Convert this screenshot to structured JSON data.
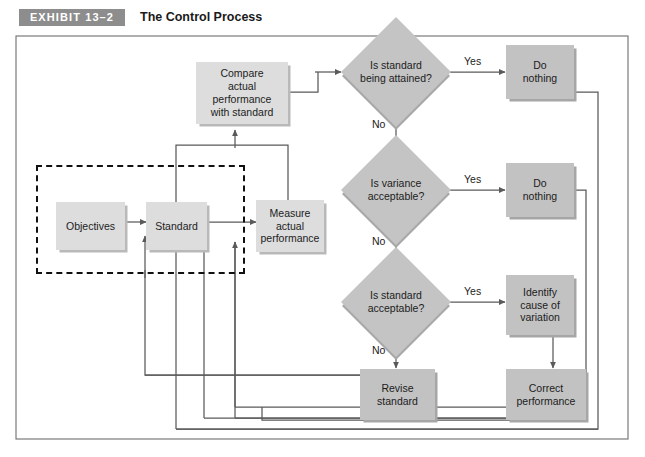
{
  "header": {
    "exhibit_badge": "EXHIBIT 13–2",
    "title": "The Control Process"
  },
  "diagram": {
    "type": "flowchart",
    "nodes": {
      "objectives": "Objectives",
      "standard": "Standard",
      "measure": "Measure\nactual\nperformance",
      "compare": "Compare\nactual\nperformance\nwith standard",
      "do_nothing_1": "Do\nnothing",
      "do_nothing_2": "Do\nnothing",
      "identify_cause": "Identify\ncause of\nvariation",
      "revise_standard": "Revise\nstandard",
      "correct_performance": "Correct\nperformance"
    },
    "decisions": {
      "attained": "Is standard\nbeing attained?",
      "variance": "Is variance\nacceptable?",
      "acceptable": "Is standard\nacceptable?"
    },
    "edge_labels": {
      "yes_1": "Yes",
      "no_1": "No",
      "yes_2": "Yes",
      "no_2": "No",
      "yes_3": "Yes",
      "no_3": "No"
    },
    "colors": {
      "node_light": "#dddddd",
      "node_dark": "#c2c2c2",
      "diamond": "#c4c4c4",
      "badge": "#8d8d8d",
      "line": "#5a5a5a",
      "shadow": "#aaaaaa"
    }
  }
}
